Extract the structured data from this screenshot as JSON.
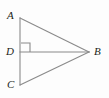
{
  "figure": {
    "kind": "geometry-diagram",
    "background_color": "#fdfdfd",
    "stroke_color": "#8a8a8a",
    "label_color": "#231f20",
    "width": 109,
    "height": 98
  },
  "labels": {
    "a": "A",
    "b": "B",
    "c": "C",
    "d": "D"
  },
  "points": {
    "A": {
      "x": 20,
      "y": 18
    },
    "C": {
      "x": 20,
      "y": 85
    },
    "D": {
      "x": 20,
      "y": 52
    },
    "B": {
      "x": 89,
      "y": 52
    }
  },
  "segments": [
    {
      "name": "AC",
      "from": "A",
      "to": "C"
    },
    {
      "name": "AB",
      "from": "A",
      "to": "B"
    },
    {
      "name": "CB",
      "from": "C",
      "to": "B"
    },
    {
      "name": "DB",
      "from": "D",
      "to": "B"
    }
  ],
  "right_angle_marker": {
    "at": "D",
    "size": 9,
    "x": 21,
    "y": 43
  }
}
